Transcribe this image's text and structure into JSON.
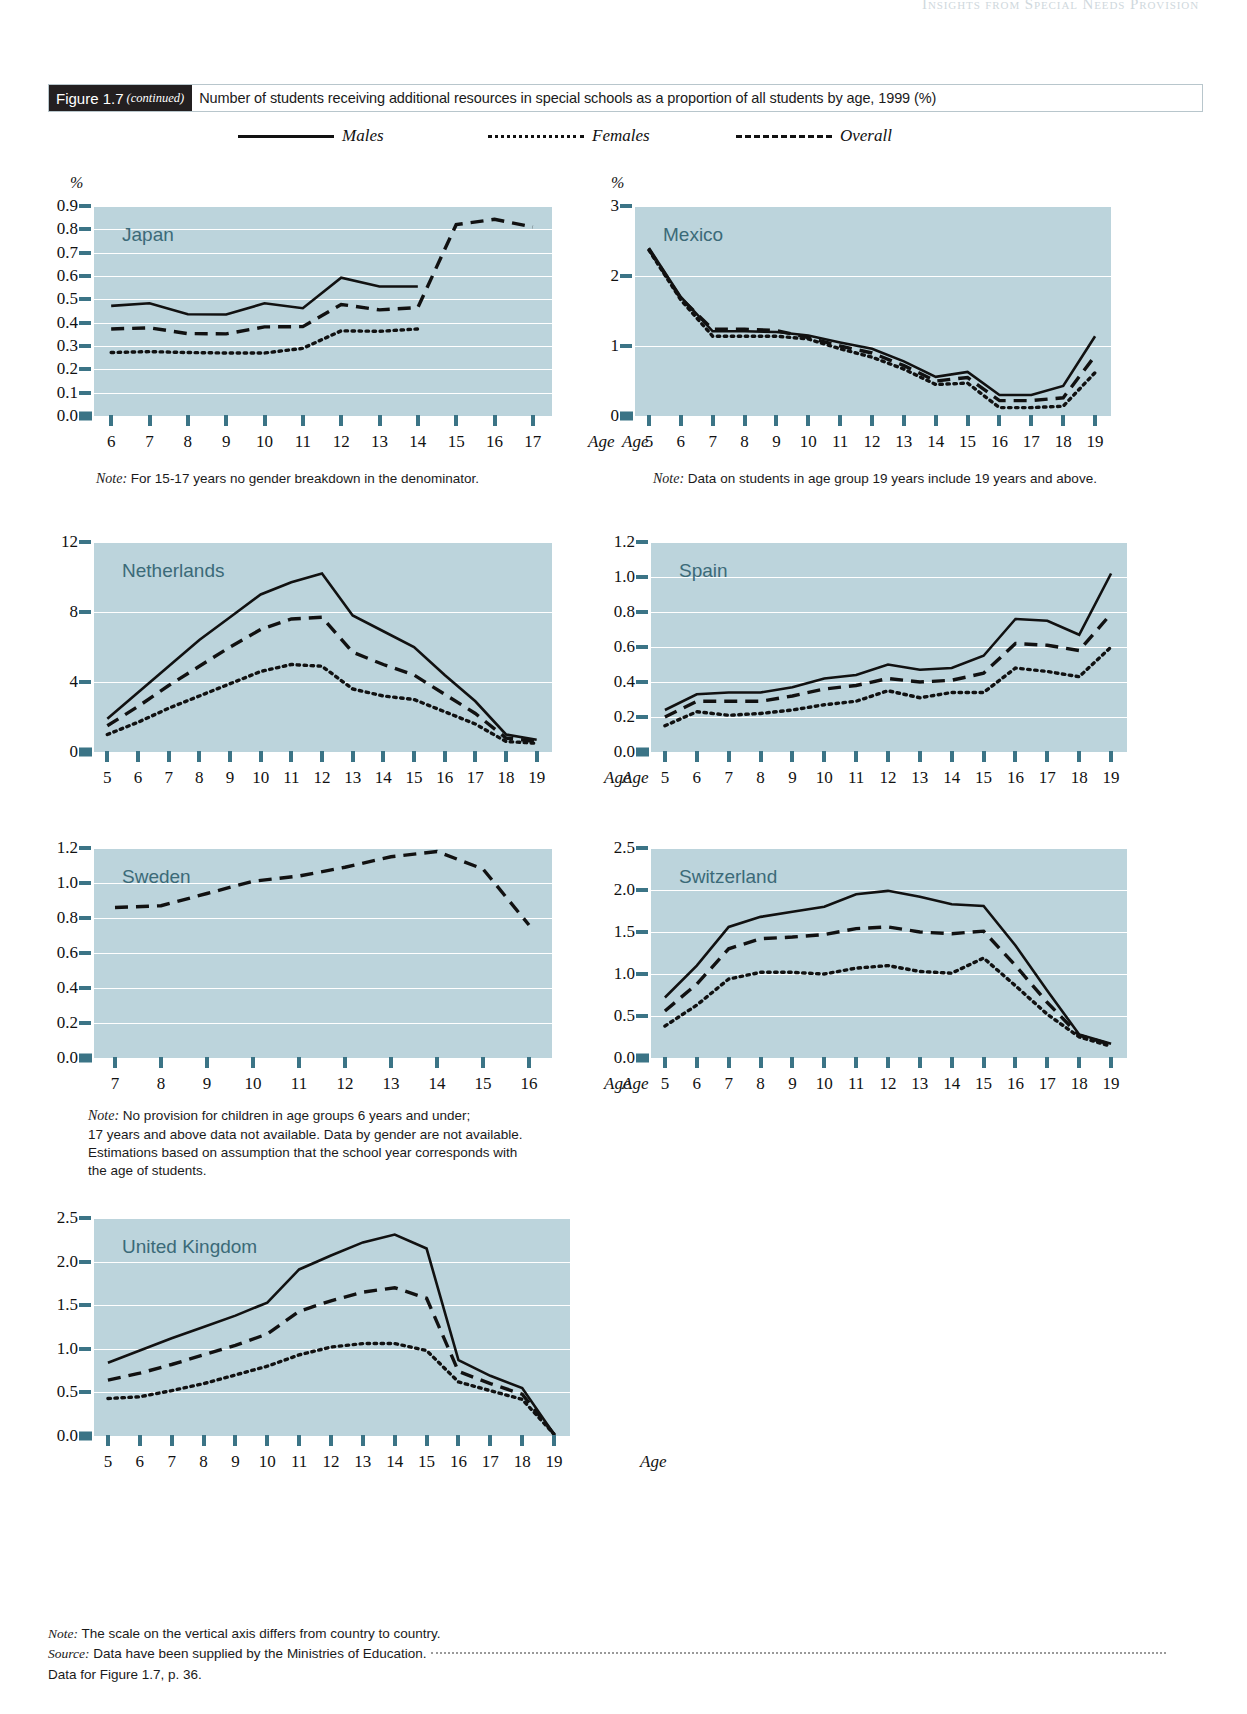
{
  "running_header": "Insights from Special Needs Provision",
  "figure": {
    "number": "Figure 1.7",
    "continued": "(continued)",
    "title": "Number of students receiving additional resources in special schools as a proportion of all students by age, 1999 (%)"
  },
  "legend": {
    "items": [
      {
        "label": "Males",
        "style": "solid"
      },
      {
        "label": "Females",
        "style": "dotted"
      },
      {
        "label": "Overall",
        "style": "dashed"
      }
    ]
  },
  "axis_labels": {
    "percent": "%",
    "age": "Age"
  },
  "notes": {
    "japan": "Note: For 15-17 years no gender breakdown in the denominator.",
    "japan_label": "Note:",
    "japan_text": " For 15-17 years no gender breakdown in the denominator.",
    "mexico_label": "Note:",
    "mexico_text": " Data on students in age group 19 years include 19 years and above.",
    "sweden_label": "Note:",
    "sweden_text": " No provision for children in age groups 6 years and under;\n17 years and above data not available. Data by gender are not available.\nEstimations based on assumption that the school year corresponds with\nthe age of students."
  },
  "footer": {
    "note_label": "Note:",
    "note_text": " The scale on the vertical axis differs from country to country.",
    "source_label": "Source:",
    "source_text": " Data have been supplied by the Ministries of Education.",
    "data_ref": "Data for Figure 1.7, p. 36."
  },
  "colors": {
    "plot_background": "#bcd4dc",
    "gridline": "#ffffff",
    "tick": "#3b7486",
    "country_label": "#3b6a78",
    "line": "#111111",
    "figure_number_bg": "#231f20"
  },
  "chart_data": [
    {
      "type": "line",
      "title": "Japan",
      "xlabel": "Age",
      "ylabel": "%",
      "x": [
        6,
        7,
        8,
        9,
        10,
        11,
        12,
        13,
        14,
        15,
        16,
        17
      ],
      "xtick_labels": [
        "6",
        "7",
        "8",
        "9",
        "10",
        "11",
        "12",
        "13",
        "14",
        "15",
        "16",
        "17"
      ],
      "ylim": [
        0.0,
        0.9
      ],
      "ytick_labels": [
        "0.0",
        "0.1",
        "0.2",
        "0.3",
        "0.4",
        "0.5",
        "0.6",
        "0.7",
        "0.8",
        "0.9"
      ],
      "yticks": [
        0.0,
        0.1,
        0.2,
        0.3,
        0.4,
        0.5,
        0.6,
        0.7,
        0.8,
        0.9
      ],
      "grid": true,
      "legend_position": "top",
      "series": [
        {
          "name": "Males",
          "style": "solid",
          "values": [
            0.472,
            0.483,
            0.436,
            0.435,
            0.483,
            0.462,
            0.593,
            0.555,
            0.555,
            null,
            null,
            null
          ]
        },
        {
          "name": "Females",
          "style": "dotted",
          "values": [
            0.272,
            0.276,
            0.272,
            0.27,
            0.27,
            0.29,
            0.365,
            0.363,
            0.373,
            null,
            null,
            null
          ]
        },
        {
          "name": "Overall",
          "style": "dashed",
          "values": [
            0.373,
            0.378,
            0.353,
            0.352,
            0.382,
            0.383,
            0.478,
            0.455,
            0.465,
            0.82,
            0.843,
            0.81
          ]
        }
      ]
    },
    {
      "type": "line",
      "title": "Mexico",
      "xlabel": "Age",
      "ylabel": "%",
      "x": [
        5,
        6,
        7,
        8,
        9,
        10,
        11,
        12,
        13,
        14,
        15,
        16,
        17,
        18,
        19
      ],
      "xtick_labels": [
        "5",
        "6",
        "7",
        "8",
        "9",
        "10",
        "11",
        "12",
        "13",
        "14",
        "15",
        "16",
        "17",
        "18",
        "19"
      ],
      "ylim": [
        0,
        3
      ],
      "ytick_labels": [
        "0",
        "1",
        "2",
        "3"
      ],
      "yticks": [
        0,
        1,
        2,
        3
      ],
      "grid": true,
      "legend_position": "top",
      "series": [
        {
          "name": "Males",
          "style": "solid",
          "values": [
            2.4,
            1.7,
            1.21,
            1.21,
            1.2,
            1.15,
            1.05,
            0.96,
            0.78,
            0.56,
            0.63,
            0.3,
            0.3,
            0.43,
            1.14
          ]
        },
        {
          "name": "Females",
          "style": "dotted",
          "values": [
            2.37,
            1.66,
            1.14,
            1.14,
            1.14,
            1.1,
            0.96,
            0.84,
            0.67,
            0.45,
            0.47,
            0.12,
            0.12,
            0.14,
            0.62
          ]
        },
        {
          "name": "Overall",
          "style": "dashed",
          "values": [
            2.38,
            1.68,
            1.24,
            1.24,
            1.22,
            1.12,
            1.0,
            0.9,
            0.72,
            0.5,
            0.55,
            0.22,
            0.22,
            0.26,
            0.86
          ]
        }
      ]
    },
    {
      "type": "line",
      "title": "Netherlands",
      "xlabel": "Age",
      "ylabel": "",
      "x": [
        5,
        6,
        7,
        8,
        9,
        10,
        11,
        12,
        13,
        14,
        15,
        16,
        17,
        18,
        19
      ],
      "xtick_labels": [
        "5",
        "6",
        "7",
        "8",
        "9",
        "10",
        "11",
        "12",
        "13",
        "14",
        "15",
        "16",
        "17",
        "18",
        "19"
      ],
      "ylim": [
        0,
        12
      ],
      "ytick_labels": [
        "0",
        "4",
        "8",
        "12"
      ],
      "yticks": [
        0,
        4,
        8,
        12
      ],
      "grid": true,
      "legend_position": "top",
      "series": [
        {
          "name": "Males",
          "style": "solid",
          "values": [
            1.9,
            3.4,
            4.9,
            6.4,
            7.7,
            9.0,
            9.7,
            10.2,
            7.8,
            6.9,
            6.0,
            4.4,
            2.9,
            1.0,
            0.7
          ]
        },
        {
          "name": "Females",
          "style": "dotted",
          "values": [
            1.0,
            1.7,
            2.5,
            3.2,
            3.9,
            4.6,
            5.0,
            4.9,
            3.6,
            3.2,
            3.0,
            2.3,
            1.6,
            0.6,
            0.5
          ]
        },
        {
          "name": "Overall",
          "style": "dashed",
          "values": [
            1.5,
            2.6,
            3.8,
            4.9,
            6.0,
            7.0,
            7.6,
            7.7,
            5.7,
            5.0,
            4.4,
            3.3,
            2.2,
            0.8,
            0.6
          ]
        }
      ]
    },
    {
      "type": "line",
      "title": "Spain",
      "xlabel": "Age",
      "ylabel": "",
      "x": [
        5,
        6,
        7,
        8,
        9,
        10,
        11,
        12,
        13,
        14,
        15,
        16,
        17,
        18,
        19
      ],
      "xtick_labels": [
        "5",
        "6",
        "7",
        "8",
        "9",
        "10",
        "11",
        "12",
        "13",
        "14",
        "15",
        "16",
        "17",
        "18",
        "19"
      ],
      "ylim": [
        0.0,
        1.2
      ],
      "ytick_labels": [
        "0.0",
        "0.2",
        "0.4",
        "0.6",
        "0.8",
        "1.0",
        "1.2"
      ],
      "yticks": [
        0.0,
        0.2,
        0.4,
        0.6,
        0.8,
        1.0,
        1.2
      ],
      "grid": true,
      "legend_position": "top",
      "series": [
        {
          "name": "Males",
          "style": "solid",
          "values": [
            0.24,
            0.33,
            0.34,
            0.34,
            0.37,
            0.42,
            0.44,
            0.5,
            0.47,
            0.48,
            0.55,
            0.76,
            0.75,
            0.67,
            1.02
          ]
        },
        {
          "name": "Females",
          "style": "dotted",
          "values": [
            0.15,
            0.23,
            0.21,
            0.22,
            0.24,
            0.27,
            0.29,
            0.35,
            0.31,
            0.34,
            0.34,
            0.48,
            0.46,
            0.43,
            0.6
          ]
        },
        {
          "name": "Overall",
          "style": "dashed",
          "values": [
            0.2,
            0.29,
            0.29,
            0.29,
            0.32,
            0.36,
            0.38,
            0.42,
            0.4,
            0.41,
            0.45,
            0.62,
            0.61,
            0.58,
            0.79
          ]
        }
      ]
    },
    {
      "type": "line",
      "title": "Sweden",
      "xlabel": "Age",
      "ylabel": "",
      "x": [
        7,
        8,
        9,
        10,
        11,
        12,
        13,
        14,
        15,
        16
      ],
      "xtick_labels": [
        "7",
        "8",
        "9",
        "10",
        "11",
        "12",
        "13",
        "14",
        "15",
        "16"
      ],
      "ylim": [
        0.0,
        1.2
      ],
      "ytick_labels": [
        "0.0",
        "0.2",
        "0.4",
        "0.6",
        "0.8",
        "1.0",
        "1.2"
      ],
      "yticks": [
        0.0,
        0.2,
        0.4,
        0.6,
        0.8,
        1.0,
        1.2
      ],
      "grid": true,
      "legend_position": "top",
      "series": [
        {
          "name": "Overall",
          "style": "dashed",
          "values": [
            0.86,
            0.87,
            0.94,
            1.01,
            1.04,
            1.09,
            1.15,
            1.18,
            1.08,
            0.76
          ]
        }
      ]
    },
    {
      "type": "line",
      "title": "Switzerland",
      "xlabel": "Age",
      "ylabel": "",
      "x": [
        5,
        6,
        7,
        8,
        9,
        10,
        11,
        12,
        13,
        14,
        15,
        16,
        17,
        18,
        19
      ],
      "xtick_labels": [
        "5",
        "6",
        "7",
        "8",
        "9",
        "10",
        "11",
        "12",
        "13",
        "14",
        "15",
        "16",
        "17",
        "18",
        "19"
      ],
      "ylim": [
        0.0,
        2.5
      ],
      "ytick_labels": [
        "0.0",
        "0.5",
        "1.0",
        "1.5",
        "2.0",
        "2.5"
      ],
      "yticks": [
        0.0,
        0.5,
        1.0,
        1.5,
        2.0,
        2.5
      ],
      "grid": true,
      "legend_position": "top",
      "series": [
        {
          "name": "Males",
          "style": "solid",
          "values": [
            0.72,
            1.1,
            1.56,
            1.68,
            1.74,
            1.8,
            1.95,
            1.99,
            1.92,
            1.83,
            1.81,
            1.34,
            0.8,
            0.28,
            0.17
          ]
        },
        {
          "name": "Females",
          "style": "dotted",
          "values": [
            0.38,
            0.63,
            0.94,
            1.02,
            1.02,
            1.0,
            1.07,
            1.1,
            1.03,
            1.01,
            1.19,
            0.86,
            0.52,
            0.25,
            0.14
          ]
        },
        {
          "name": "Overall",
          "style": "dashed",
          "values": [
            0.56,
            0.88,
            1.3,
            1.42,
            1.44,
            1.47,
            1.54,
            1.56,
            1.5,
            1.48,
            1.51,
            1.1,
            0.66,
            0.27,
            0.16
          ]
        }
      ]
    },
    {
      "type": "line",
      "title": "United Kingdom",
      "xlabel": "Age",
      "ylabel": "",
      "x": [
        5,
        6,
        7,
        8,
        9,
        10,
        11,
        12,
        13,
        14,
        15,
        16,
        17,
        18,
        19
      ],
      "xtick_labels": [
        "5",
        "6",
        "7",
        "8",
        "9",
        "10",
        "11",
        "12",
        "13",
        "14",
        "15",
        "16",
        "17",
        "18",
        "19"
      ],
      "ylim": [
        0.0,
        2.5
      ],
      "ytick_labels": [
        "0.0",
        "0.5",
        "1.0",
        "1.5",
        "2.0",
        "2.5"
      ],
      "yticks": [
        0.0,
        0.5,
        1.0,
        1.5,
        2.0,
        2.5
      ],
      "grid": true,
      "legend_position": "top",
      "series": [
        {
          "name": "Males",
          "style": "solid",
          "values": [
            0.84,
            0.98,
            1.12,
            1.25,
            1.38,
            1.53,
            1.91,
            2.07,
            2.22,
            2.31,
            2.15,
            0.87,
            0.69,
            0.55,
            0.02
          ]
        },
        {
          "name": "Females",
          "style": "dotted",
          "values": [
            0.43,
            0.45,
            0.52,
            0.6,
            0.7,
            0.8,
            0.93,
            1.02,
            1.06,
            1.06,
            0.98,
            0.62,
            0.52,
            0.42,
            0.02
          ]
        },
        {
          "name": "Overall",
          "style": "dashed",
          "values": [
            0.64,
            0.72,
            0.82,
            0.93,
            1.04,
            1.17,
            1.43,
            1.55,
            1.65,
            1.7,
            1.58,
            0.74,
            0.6,
            0.48,
            0.02
          ]
        }
      ]
    }
  ]
}
